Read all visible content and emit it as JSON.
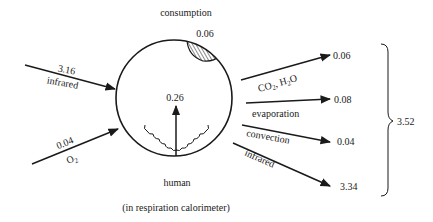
{
  "diagram": {
    "title_top": "consumption",
    "consumption_value": "0.06",
    "internal_value": "0.26",
    "subject_label": "human",
    "context_label": "(in respiration calorimeter)",
    "inputs": [
      {
        "value": "3.16",
        "label": "infrared"
      },
      {
        "value": "0.04",
        "label_main": "O",
        "label_sub": "2"
      }
    ],
    "outputs": [
      {
        "value": "0.06",
        "label_parts": [
          "CO",
          "2",
          ", H",
          "2",
          "O"
        ]
      },
      {
        "value": "0.08",
        "label": "evaporation"
      },
      {
        "value": "0.04",
        "label": "convection"
      },
      {
        "value": "3.34",
        "label": "infrared"
      }
    ],
    "total_output": "3.52",
    "colors": {
      "ink": "#1a1a1a",
      "background": "#ffffff"
    }
  }
}
